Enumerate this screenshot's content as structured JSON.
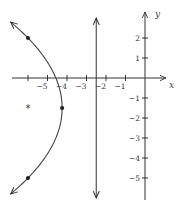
{
  "chart_data": {
    "type": "diagram",
    "title": "",
    "xlabel": "x",
    "ylabel": "y",
    "xlim": [
      -7,
      2.5
    ],
    "ylim": [
      -6.1,
      3.8
    ],
    "x_ticks": [
      {
        "value": -6,
        "label": ""
      },
      {
        "value": -5,
        "label": "−5"
      },
      {
        "value": -4,
        "label": "−4"
      },
      {
        "value": -3,
        "label": "−3"
      },
      {
        "value": -2,
        "label": "−2"
      },
      {
        "value": -1,
        "label": "−1"
      }
    ],
    "y_ticks": [
      {
        "value": 2,
        "label": "2"
      },
      {
        "value": 1,
        "label": "1"
      },
      {
        "value": -1,
        "label": "−1"
      },
      {
        "value": -2,
        "label": "−2"
      },
      {
        "value": -3,
        "label": "−3"
      },
      {
        "value": -4,
        "label": "−4"
      },
      {
        "value": -5,
        "label": "−5"
      }
    ],
    "parabola": {
      "equation": "x = -4.25 - (1/7)(y + 1.5)^2",
      "vertex": [
        -4.25,
        -1.5
      ],
      "a": 0.142857,
      "y_range": [
        -5.8,
        2.8
      ],
      "arrows_both_ends": true
    },
    "points": [
      {
        "name": "vertex",
        "x": -4.25,
        "y": -1.5
      },
      {
        "name": "upper-point",
        "x": -6,
        "y": 2
      },
      {
        "name": "lower-point",
        "x": -6,
        "y": -5
      }
    ],
    "focus": {
      "x": -6,
      "y": -1.5,
      "marker": "*"
    },
    "directrix": {
      "x": -2.5,
      "y_range": [
        -6.0,
        3.0
      ]
    }
  }
}
